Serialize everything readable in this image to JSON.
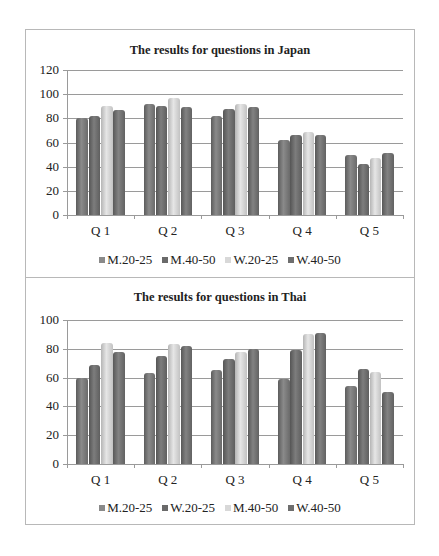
{
  "chart_data": [
    {
      "type": "bar",
      "title": "The results for questions in Japan",
      "categories": [
        "Q 1",
        "Q 2",
        "Q 3",
        "Q 4",
        "Q 5"
      ],
      "series": [
        {
          "name": "M.20-25",
          "values": [
            80,
            92,
            82,
            62,
            50
          ],
          "color": "#717171"
        },
        {
          "name": "M.40-50",
          "values": [
            82,
            90,
            88,
            66,
            42
          ],
          "color": "#696969"
        },
        {
          "name": "W.20-25",
          "values": [
            90,
            97,
            92,
            69,
            47
          ],
          "color": "#d0d0d0"
        },
        {
          "name": "W.40-50",
          "values": [
            87,
            89,
            89,
            66,
            51
          ],
          "color": "#6c6c6c"
        }
      ],
      "xlabel": "",
      "ylabel": "",
      "ylim": [
        0,
        120
      ],
      "yticks": [
        0,
        20,
        40,
        60,
        80,
        100,
        120
      ],
      "grid": true,
      "legend_position": "bottom"
    },
    {
      "type": "bar",
      "title": "The results for questions in Thai",
      "categories": [
        "Q 1",
        "Q 2",
        "Q 3",
        "Q 4",
        "Q 5"
      ],
      "series": [
        {
          "name": "M.20-25",
          "values": [
            60,
            63,
            65,
            59,
            54
          ],
          "color": "#717171"
        },
        {
          "name": "W.20-25",
          "values": [
            69,
            75,
            73,
            79,
            66
          ],
          "color": "#696969"
        },
        {
          "name": "M.40-50",
          "values": [
            84,
            83,
            78,
            90,
            64
          ],
          "color": "#d0d0d0"
        },
        {
          "name": "W.40-50",
          "values": [
            78,
            82,
            80,
            91,
            50
          ],
          "color": "#6c6c6c"
        }
      ],
      "xlabel": "",
      "ylabel": "",
      "ylim": [
        0,
        100
      ],
      "yticks": [
        0,
        20,
        40,
        60,
        80,
        100
      ],
      "grid": true,
      "legend_position": "bottom"
    }
  ]
}
